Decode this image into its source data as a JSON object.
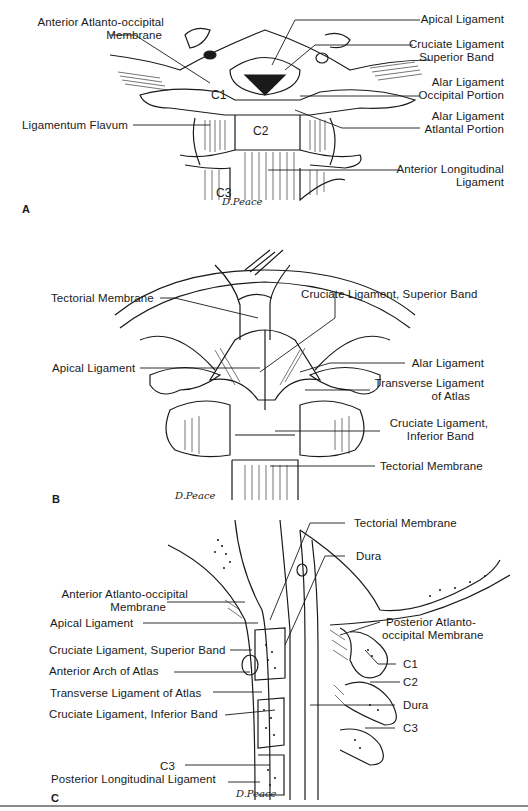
{
  "figure": {
    "panels": [
      {
        "letter": "A",
        "signature": "D.Peace",
        "vertebra_labels": [
          "C1",
          "C2",
          "C3"
        ],
        "left_labels": [
          {
            "line1": "Anterior Atlanto-occipital",
            "line2": "Membrane"
          },
          {
            "line1": "Ligamentum Flavum"
          }
        ],
        "right_labels": [
          {
            "line1": "Apical Ligament"
          },
          {
            "line1": "Cruciate Ligament",
            "line2": "Superior Band"
          },
          {
            "line1": "Alar Ligament",
            "line2": "Occipital Portion"
          },
          {
            "line1": "Alar Ligament",
            "line2": "Atlantal Portion"
          },
          {
            "line1": "Anterior Longitudinal",
            "line2": "Ligament"
          }
        ]
      },
      {
        "letter": "B",
        "signature": "D.Peace",
        "left_labels": [
          {
            "line1": "Tectorial Membrane"
          },
          {
            "line1": "Apical Ligament"
          }
        ],
        "right_labels": [
          {
            "line1": "Cruciate Ligament, Superior Band"
          },
          {
            "line1": "Alar Ligament"
          },
          {
            "line1": "Transverse Ligament",
            "line2": "of Atlas"
          },
          {
            "line1": "Cruciate Ligament,",
            "line2": "Inferior Band"
          },
          {
            "line1": "Tectorial Membrane"
          }
        ]
      },
      {
        "letter": "C",
        "signature": "D.Peace",
        "left_labels": [
          {
            "line1": "Anterior Atlanto-occipital",
            "line2": "Membrane"
          },
          {
            "line1": "Apical Ligament"
          },
          {
            "line1": "Cruciate Ligament, Superior Band"
          },
          {
            "line1": "Anterior Arch of Atlas"
          },
          {
            "line1": "Transverse Ligament of Atlas"
          },
          {
            "line1": "Cruciate Ligament, Inferior Band"
          },
          {
            "line1": "C3"
          },
          {
            "line1": "Posterior Longitudinal Ligament"
          }
        ],
        "right_labels": [
          {
            "line1": "Tectorial Membrane"
          },
          {
            "line1": "Dura"
          },
          {
            "line1": "Posterior Atlanto-",
            "line2": "occipital Membrane"
          },
          {
            "line1": "C1"
          },
          {
            "line1": "C2"
          },
          {
            "line1": "Dura"
          },
          {
            "line1": "C3"
          }
        ]
      }
    ],
    "colors": {
      "ink": "#1a1a1a",
      "background": "#ffffff",
      "rule": "#8a8a8a"
    }
  }
}
